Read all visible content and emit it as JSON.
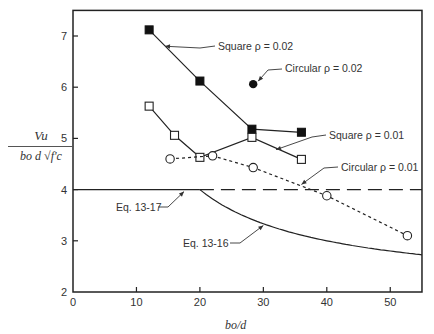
{
  "chart_data": {
    "type": "line",
    "title": "",
    "xlabel": "b_o/d",
    "ylabel": "V_u / (b_o d √f'_c)",
    "xlim": [
      0,
      55
    ],
    "ylim": [
      2,
      7.5
    ],
    "xticks": [
      0,
      10,
      20,
      30,
      40,
      50
    ],
    "yticks": [
      2,
      3,
      4,
      5,
      6,
      7
    ],
    "grid": false,
    "legend": "inline annotations",
    "series": [
      {
        "name": "Square ρ = 0.02",
        "marker": "filled-square",
        "line": "solid",
        "x": [
          12,
          20,
          28.2,
          36
        ],
        "y": [
          7.12,
          6.12,
          5.18,
          5.12
        ]
      },
      {
        "name": "Circular ρ = 0.02",
        "marker": "filled-circle",
        "line": "none",
        "x": [
          28.4
        ],
        "y": [
          6.06
        ]
      },
      {
        "name": "Square ρ = 0.01",
        "marker": "open-square",
        "line": "solid",
        "x": [
          12,
          16,
          20,
          28.2,
          36
        ],
        "y": [
          5.63,
          5.06,
          4.63,
          5.02,
          4.59
        ]
      },
      {
        "name": "Circular ρ = 0.01",
        "marker": "open-circle",
        "line": "dashed",
        "x": [
          15.3,
          22,
          28.4,
          40,
          52.7
        ],
        "y": [
          4.6,
          4.66,
          4.43,
          3.88,
          3.1
        ]
      },
      {
        "name": "Eq. 13-17",
        "marker": "none",
        "line": "solid",
        "x": [
          0,
          20
        ],
        "y": [
          4,
          4
        ]
      },
      {
        "name": "Eq. 13-17 (extension)",
        "marker": "none",
        "line": "long-dash",
        "x": [
          20,
          55
        ],
        "y": [
          4,
          4
        ]
      },
      {
        "name": "Eq. 13-16",
        "marker": "none",
        "line": "solid",
        "formula": "40/(b_o/d) + 2",
        "x": [
          20,
          25,
          30,
          35,
          40,
          45,
          50,
          55
        ],
        "y": [
          4,
          3.6,
          3.33,
          3.14,
          3.0,
          2.89,
          2.8,
          2.73
        ]
      }
    ],
    "annotations": [
      {
        "text": "Square ρ = 0.02",
        "points_to": [
          14.5,
          6.8
        ]
      },
      {
        "text": "Circular ρ = 0.02",
        "points_to": [
          28.4,
          6.06
        ]
      },
      {
        "text": "Square ρ = 0.01",
        "points_to": [
          32,
          4.78
        ]
      },
      {
        "text": "Circular ρ = 0.01",
        "points_to": [
          36,
          4.13
        ]
      },
      {
        "text": "Eq. 13-17",
        "points_to": [
          17.5,
          4
        ]
      },
      {
        "text": "Eq. 13-16",
        "points_to": [
          30,
          3.3
        ]
      }
    ]
  },
  "labels": {
    "y_num": "Vu",
    "y_den": "bo d √f'c",
    "x": "bo/d",
    "ann_sq02": "Square ρ = 0.02",
    "ann_ci02": "Circular ρ = 0.02",
    "ann_sq01": "Square ρ = 0.01",
    "ann_ci01": "Circular ρ = 0.01",
    "ann_eq17": "Eq. 13-17",
    "ann_eq16": "Eq. 13-16"
  }
}
